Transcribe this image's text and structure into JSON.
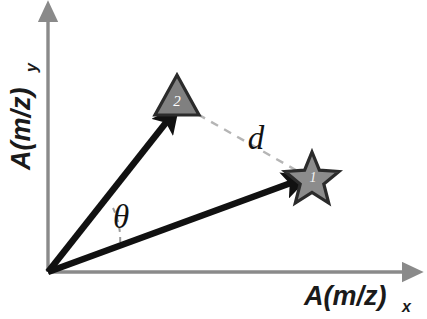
{
  "figure": {
    "type": "vector-diagram",
    "background_color": "#ffffff"
  },
  "axes": {
    "color": "#8a8a8a",
    "origin": {
      "x": 48,
      "y": 272
    },
    "x_axis": {
      "label_main": "A(m/z)",
      "label_sub": "x",
      "arrow": "arrow-right-icon",
      "end": {
        "x": 415,
        "y": 272
      }
    },
    "y_axis": {
      "label_main": "A(m/z)",
      "label_sub": "y",
      "arrow": "arrow-up-icon",
      "end": {
        "x": 48,
        "y": 10
      }
    }
  },
  "vectors": [
    {
      "id": "vector-1",
      "marker_label": "1",
      "marker_shape": "star",
      "color": "#111111",
      "tip": {
        "x": 305,
        "y": 177
      },
      "origin": {
        "x": 48,
        "y": 272
      }
    },
    {
      "id": "vector-2",
      "marker_label": "2",
      "marker_shape": "triangle",
      "color": "#111111",
      "tip": {
        "x": 175,
        "y": 109
      },
      "origin": {
        "x": 48,
        "y": 272
      }
    }
  ],
  "markers": {
    "triangle": {
      "label": "2",
      "fill": "#808080",
      "stroke": "#2b2b2b",
      "center": {
        "x": 177,
        "y": 98
      }
    },
    "star": {
      "label": "1",
      "fill": "#8c8c8c",
      "stroke": "#2b2b2b",
      "center": {
        "x": 312,
        "y": 178
      }
    }
  },
  "annotations": {
    "distance": {
      "symbol": "d",
      "style": "dashed",
      "color": "#b3b3b3",
      "from": {
        "x": 183,
        "y": 106
      },
      "to": {
        "x": 303,
        "y": 174
      },
      "label_position": {
        "x": 245,
        "y": 148
      }
    },
    "angle": {
      "symbol": "θ",
      "style": "dashed-arc",
      "color": "#9a9a9a",
      "label_position": {
        "x": 108,
        "y": 228
      },
      "arc_radius": 72
    }
  }
}
